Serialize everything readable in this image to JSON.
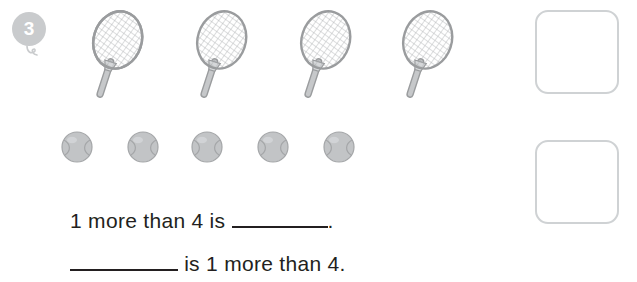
{
  "question": {
    "number": "3",
    "number_badge_color": "#c9cbcd"
  },
  "objects": {
    "rackets": {
      "icon": "tennis-racket-icon",
      "count": 4,
      "label": "tennis racket",
      "color": "#b9bbbd"
    },
    "balls": {
      "icon": "tennis-ball-icon",
      "count": 5,
      "label": "tennis ball",
      "color": "#b9bbbd"
    }
  },
  "sentences": [
    {
      "id": "sentence-one",
      "before_blank": "1 more than 4 is ",
      "after_blank": "."
    },
    {
      "id": "sentence-two",
      "before_blank": "",
      "after_blank": " is 1 more than 4."
    }
  ],
  "answer_boxes": [
    {
      "id": "answer-box-top",
      "value": ""
    },
    {
      "id": "answer-box-bottom",
      "value": ""
    }
  ],
  "colors": {
    "text": "#231f20",
    "line": "#231f20",
    "box_border": "#cfd2d4",
    "object_fill": "#c6c8ca",
    "object_stroke": "#9a9c9e",
    "background": "#ffffff"
  }
}
